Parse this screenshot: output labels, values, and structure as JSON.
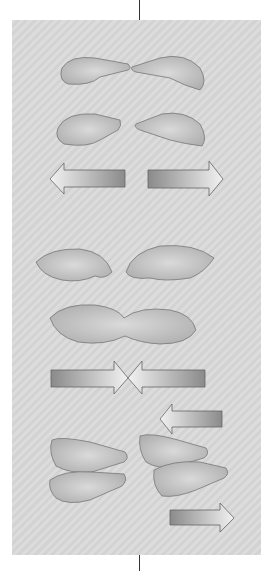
{
  "figure": {
    "panels": [
      {
        "id": "spread-hands",
        "arrows": [
          "left",
          "right"
        ],
        "motion": "apart"
      },
      {
        "id": "join-hands",
        "arrows": [
          "right",
          "left"
        ],
        "motion": "together"
      },
      {
        "id": "slide-hands",
        "arrows": [
          "left",
          "right"
        ],
        "motion": "sliding"
      }
    ],
    "colors": {
      "background": "#ffffff",
      "panel": "#d8d8d8",
      "skin": "#c8c8c8",
      "arrow_dark": "#8a8a8a",
      "arrow_light": "#eeeeee",
      "outline": "#555555"
    }
  }
}
